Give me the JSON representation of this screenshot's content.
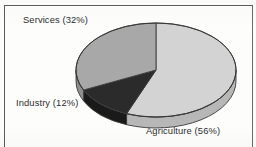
{
  "chart_data": {
    "type": "pie",
    "title": "",
    "labels": [
      "Agriculture",
      "Industry",
      "Services"
    ],
    "values": [
      56,
      12,
      32
    ],
    "value_unit": "%",
    "legend_position": "none",
    "annotations": [
      "Agriculture (56%)",
      "Industry (12%)",
      "Services (32%)"
    ],
    "slices": [
      {
        "name": "Agriculture",
        "label": "Agriculture (56%)",
        "value": 56,
        "color": "#d3d3d3",
        "side_color": "#b7b7b7",
        "start_angle_deg": 0,
        "end_angle_deg": 201.6
      },
      {
        "name": "Industry",
        "label": "Industry (12%)",
        "value": 12,
        "color": "#2b2b2b",
        "side_color": "#1a1a1a",
        "start_angle_deg": 201.6,
        "end_angle_deg": 244.8
      },
      {
        "name": "Services",
        "label": "Services (32%)",
        "value": 32,
        "color": "#a8a8a8",
        "side_color": "#8e8e8e",
        "start_angle_deg": 244.8,
        "end_angle_deg": 360
      }
    ],
    "style": {
      "three_d": true,
      "depth_px": 11,
      "center_x": 156,
      "center_y": 70,
      "radius_x": 80,
      "radius_y": 47,
      "outline_color": "#3a3a3a",
      "background": "#fdfdfc"
    }
  },
  "labels": {
    "services": "Services (32%)",
    "industry": "Industry (12%)",
    "agriculture": "Agriculture (56%)"
  }
}
